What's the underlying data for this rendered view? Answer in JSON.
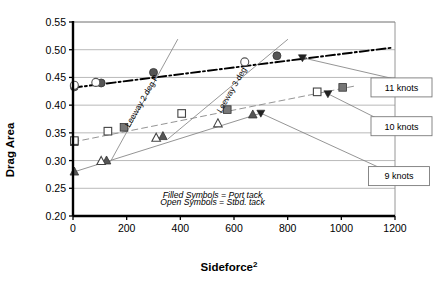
{
  "chart_data": {
    "type": "scatter",
    "title": "",
    "xlabel": "Sideforce²",
    "ylabel": "Drag Area",
    "xlim": [
      0,
      1200
    ],
    "ylim": [
      0.2,
      0.55
    ],
    "xticks": [
      0,
      200,
      400,
      600,
      800,
      1000,
      1200
    ],
    "yticks": [
      0.2,
      0.25,
      0.3,
      0.35,
      0.4,
      0.45,
      0.5,
      0.55
    ],
    "grid": "horizontal",
    "legend_position": "right-callouts",
    "annotations": [
      {
        "id": "filled",
        "text": "Filled Symbols = Port tack",
        "x": 520,
        "y": 0.232
      },
      {
        "id": "open",
        "text": "Open Symbols = Stbd. tack",
        "x": 520,
        "y": 0.22
      },
      {
        "id": "leeway2",
        "text": "Leeway 2 deg P",
        "x": 265,
        "y": 0.405
      },
      {
        "id": "leeway3",
        "text": "Leeway 3 deg",
        "x": 600,
        "y": 0.425
      }
    ],
    "callouts": [
      {
        "label": "11 knots",
        "x": 1255,
        "y": 0.432
      },
      {
        "label": "10 knots",
        "x": 1245,
        "y": 0.362
      },
      {
        "label": "9 knots",
        "x": 1215,
        "y": 0.272
      }
    ],
    "series": [
      {
        "name": "11 knots port",
        "marker": "circle-filled",
        "color": "#555555",
        "points": [
          {
            "x": 5,
            "y": 0.433
          },
          {
            "x": 105,
            "y": 0.44
          },
          {
            "x": 300,
            "y": 0.459
          },
          {
            "x": 760,
            "y": 0.489
          }
        ]
      },
      {
        "name": "11 knots stbd",
        "marker": "circle-open",
        "color": "#555555",
        "points": [
          {
            "x": 5,
            "y": 0.436
          },
          {
            "x": 85,
            "y": 0.441
          },
          {
            "x": 640,
            "y": 0.478
          }
        ]
      },
      {
        "name": "10 knots port",
        "marker": "square-filled",
        "color": "#777777",
        "points": [
          {
            "x": 5,
            "y": 0.334
          },
          {
            "x": 190,
            "y": 0.36
          },
          {
            "x": 575,
            "y": 0.392
          },
          {
            "x": 1005,
            "y": 0.432
          }
        ]
      },
      {
        "name": "10 knots stbd",
        "marker": "square-open",
        "color": "#444444",
        "points": [
          {
            "x": 5,
            "y": 0.336
          },
          {
            "x": 130,
            "y": 0.353
          },
          {
            "x": 405,
            "y": 0.385
          },
          {
            "x": 910,
            "y": 0.424
          }
        ]
      },
      {
        "name": "9 knots port",
        "marker": "triangle-filled",
        "color": "#555555",
        "points": [
          {
            "x": 5,
            "y": 0.28
          },
          {
            "x": 125,
            "y": 0.3
          },
          {
            "x": 335,
            "y": 0.344
          },
          {
            "x": 670,
            "y": 0.383
          }
        ]
      },
      {
        "name": "9 knots stbd",
        "marker": "triangle-open",
        "color": "#444444",
        "points": [
          {
            "x": 105,
            "y": 0.299
          },
          {
            "x": 310,
            "y": 0.341
          },
          {
            "x": 540,
            "y": 0.367
          }
        ]
      }
    ],
    "fit_lines": [
      {
        "name": "11 knots fit",
        "style": "dash-dot",
        "color": "#000000",
        "width": 1.9,
        "points": [
          [
            0,
            0.4315
          ],
          [
            1185,
            0.5035
          ]
        ]
      },
      {
        "name": "10 knots fit",
        "style": "dashed",
        "color": "#888888",
        "width": 0.9,
        "points": [
          [
            0,
            0.3335
          ],
          [
            1050,
            0.4345
          ]
        ]
      },
      {
        "name": "9 knots fit",
        "style": "solid",
        "color": "#888888",
        "width": 0.9,
        "points": [
          [
            0,
            0.279
          ],
          [
            700,
            0.3855
          ]
        ]
      },
      {
        "name": "Leeway 2 deg P",
        "style": "solid",
        "color": "#8c8c8c",
        "width": 0.9,
        "points": [
          [
            140,
            0.2985
          ],
          [
            390,
            0.5185
          ]
        ]
      },
      {
        "name": "Leeway 3 deg",
        "style": "solid",
        "color": "#8c8c8c",
        "width": 0.9,
        "points": [
          [
            355,
            0.3395
          ],
          [
            800,
            0.5185
          ]
        ]
      }
    ],
    "pointer_markers": [
      {
        "name": "pointer-11knots",
        "x": 855,
        "y": 0.4855
      },
      {
        "name": "pointer-10knots",
        "x": 950,
        "y": 0.4205
      },
      {
        "name": "pointer-9knots",
        "x": 700,
        "y": 0.3855
      }
    ],
    "leaders": [
      {
        "name": "leader-11knots",
        "from": [
          855,
          0.4855
        ],
        "to": [
          1240,
          0.4425
        ]
      },
      {
        "name": "leader-10knots",
        "from": [
          950,
          0.4205
        ],
        "to": [
          1230,
          0.3525
        ]
      },
      {
        "name": "leader-9knots",
        "from": [
          700,
          0.3855
        ],
        "to": [
          1195,
          0.2755
        ]
      }
    ]
  }
}
